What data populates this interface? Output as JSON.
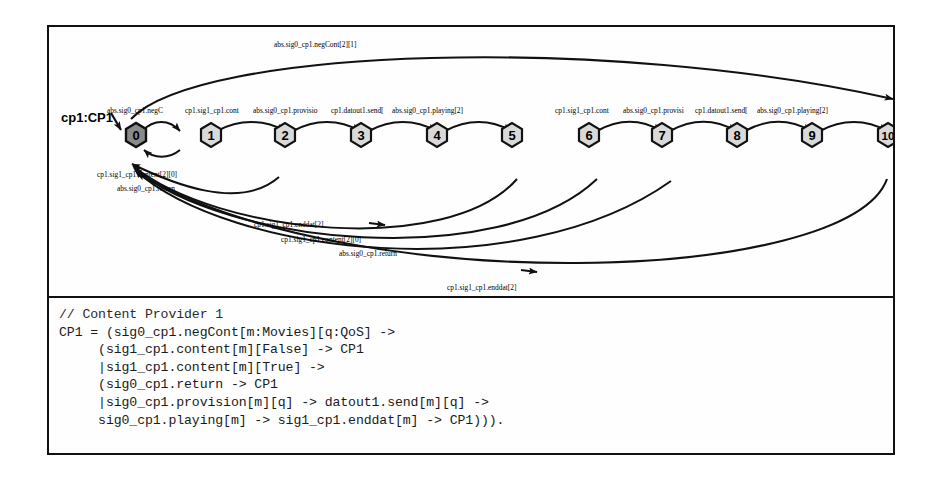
{
  "figure": {
    "process_label": "cp1:CP1",
    "automaton": {
      "states": [
        {
          "id": "0",
          "label": "0",
          "x": 124,
          "y": 136,
          "initial": true
        },
        {
          "id": "1",
          "label": "1",
          "x": 199,
          "y": 136,
          "initial": false
        },
        {
          "id": "2",
          "label": "2",
          "x": 273,
          "y": 136,
          "initial": false
        },
        {
          "id": "3",
          "label": "3",
          "x": 349,
          "y": 136,
          "initial": false
        },
        {
          "id": "4",
          "label": "4",
          "x": 425,
          "y": 136,
          "initial": false
        },
        {
          "id": "5",
          "label": "5",
          "x": 500,
          "y": 136,
          "initial": false
        },
        {
          "id": "6",
          "label": "6",
          "x": 577,
          "y": 136,
          "initial": false
        },
        {
          "id": "7",
          "label": "7",
          "x": 650,
          "y": 136,
          "initial": false
        },
        {
          "id": "8",
          "label": "8",
          "x": 725,
          "y": 136,
          "initial": false
        },
        {
          "id": "9",
          "label": "9",
          "x": 800,
          "y": 136,
          "initial": false
        },
        {
          "id": "10",
          "label": "10",
          "x": 878,
          "y": 136,
          "initial": false
        }
      ],
      "transition_labels": {
        "top_arc": "abs.sig0_cp1.negCont[2][1]",
        "row_left": [
          "abs.sig0_cp1.negC",
          "cp1.sig1_cp1.cont",
          "abs.sig0_cp1.provisio",
          "cp1.datout1.send[",
          "abs.sig0_cp1.playing[2]"
        ],
        "row_right": [
          "cp1.sig1_cp1.cont",
          "abs.sig0_cp1.provisi",
          "cp1.datout1.send[",
          "abs.sig0_cp1.playing[2]"
        ],
        "near_zero_upper": "cp1.sig1_cp1.content[2][0]",
        "near_zero_lower": "abs.sig0_cp1.return",
        "mid_stack": [
          "cp1.sig1_cp1.enddat[2]",
          "cp1.sig1_cp1.content[2][0]",
          "abs.sig0_cp1.return"
        ],
        "bottom_arc": "cp1.sig1_cp1.enddat[2]"
      },
      "colors": {
        "initial_state_fill": "#8a8a8a",
        "state_fill": "#d9d9d9",
        "state_stroke": "#111111",
        "edge_stroke": "#111111",
        "panel_background": "#fefefe"
      }
    },
    "code": {
      "lines": [
        "// Content Provider 1",
        "CP1 = (sig0_cp1.negCont[m:Movies][q:QoS] ->",
        "     (sig1_cp1.content[m][False] -> CP1",
        "     |sig1_cp1.content[m][True] ->",
        "     (sig0_cp1.return -> CP1",
        "     |sig0_cp1.provision[m][q] -> datout1.send[m][q] ->",
        "     sig0_cp1.playing[m] -> sig1_cp1.enddat[m] -> CP1)))."
      ]
    }
  }
}
